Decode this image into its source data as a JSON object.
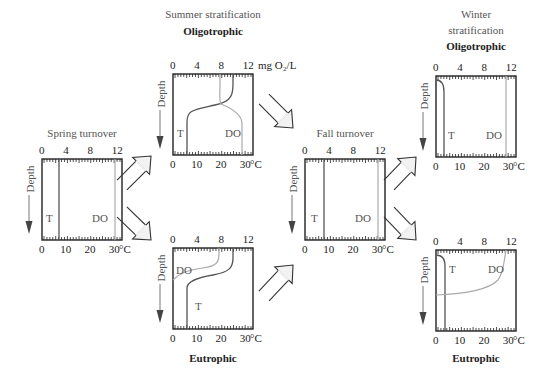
{
  "units": {
    "oxygen": "mg O₂/L",
    "temperature": "°C",
    "depth_label": "Depth"
  },
  "axis_ticks": {
    "top": [
      "0",
      "4",
      "8",
      "12"
    ],
    "bottom": [
      "0",
      "10",
      "20",
      "30"
    ]
  },
  "curve_labels": {
    "temperature": "T",
    "dissolved_oxygen": "DO"
  },
  "panels": {
    "spring": {
      "title": "Spring turnover",
      "subtitle": ""
    },
    "summer_oligo": {
      "title": "Summer stratification",
      "subtitle": "Oligotrophic"
    },
    "summer_eutro": {
      "title": "",
      "subtitle": "Eutrophic"
    },
    "fall": {
      "title": "Fall turnover",
      "subtitle": ""
    },
    "winter_oligo": {
      "title_line1": "Winter",
      "title_line2": "stratification",
      "subtitle": "Oligotrophic"
    },
    "winter_eutro": {
      "title": "",
      "subtitle": "Eutrophic"
    }
  },
  "colors": {
    "frame": "#222222",
    "temperature_line": "#555555",
    "do_line": "#aaaaaa",
    "arrow_fill": "#f2f2f2",
    "arrow_stroke": "#333333",
    "text_gray": "#555555"
  }
}
